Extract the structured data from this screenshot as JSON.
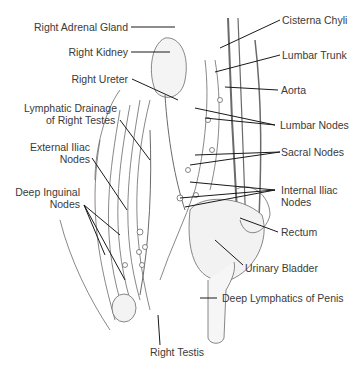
{
  "diagram": {
    "labels": {
      "right_adrenal_gland": "Right Adrenal Gland",
      "right_kidney": "Right Kidney",
      "right_ureter": "Right Ureter",
      "lymphatic_drainage_1": "Lymphatic Drainage",
      "lymphatic_drainage_2": "of Right Testes",
      "external_iliac_1": "External Iliac",
      "external_iliac_2": "Nodes",
      "deep_inguinal_1": "Deep Inguinal",
      "deep_inguinal_2": "Nodes",
      "cisterna_chyli": "Cisterna Chyli",
      "lumbar_trunk": "Lumbar Trunk",
      "aorta": "Aorta",
      "lumbar_nodes": "Lumbar Nodes",
      "sacral_nodes": "Sacral Nodes",
      "internal_iliac_1": "Internal Iliac",
      "internal_iliac_2": "Nodes",
      "rectum": "Rectum",
      "urinary_bladder": "Urinary Bladder",
      "deep_lymphatics_penis": "Deep Lymphatics of Penis",
      "right_testis": "Right Testis"
    },
    "colors": {
      "text": "#3a3a3a",
      "line": "#1a1a1a",
      "illustration": "#555555",
      "background": "#ffffff"
    }
  }
}
